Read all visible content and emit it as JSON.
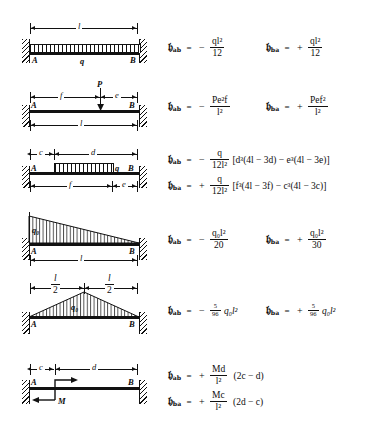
{
  "symbols": {
    "moment": "\u0001",
    "moment_ab_sub": "ab",
    "moment_ba_sub": "ba",
    "equals": "=",
    "minus": "−",
    "plus": "+",
    "node_a": "A",
    "node_b": "B"
  },
  "rows": [
    {
      "id": "uniform-full-span",
      "diagram": {
        "load_type": "uniform-distributed",
        "load_label": "q",
        "span_label": "l",
        "supports": [
          "fixed",
          "fixed"
        ],
        "nodes": [
          "A",
          "B"
        ]
      },
      "left": {
        "symbol_sub": "ab",
        "sign": "−",
        "numerator": "ql²",
        "denominator": "12",
        "num_var": "q",
        "num_var2": "l",
        "num_exp": "2"
      },
      "right": {
        "symbol_sub": "ba",
        "sign": "+",
        "numerator": "ql²",
        "denominator": "12",
        "num_var": "q",
        "num_var2": "l",
        "num_exp": "2"
      }
    },
    {
      "id": "point-load",
      "diagram": {
        "load_type": "point-load",
        "load_label": "P",
        "dim_left": "f",
        "dim_right": "e",
        "span_label": "l",
        "supports": [
          "fixed",
          "fixed"
        ],
        "nodes": [
          "A",
          "B"
        ]
      },
      "left": {
        "symbol_sub": "ab",
        "sign": "−",
        "numerator": "Pe²f",
        "denominator": "l²"
      },
      "right": {
        "symbol_sub": "ba",
        "sign": "+",
        "numerator": "Pef²",
        "denominator": "l²"
      }
    },
    {
      "id": "partial-uniform",
      "diagram": {
        "load_type": "partial-uniform-distributed",
        "load_label": "q",
        "dim_c": "c",
        "dim_d": "d",
        "dim_f": "f",
        "dim_e": "e",
        "supports": [
          "fixed",
          "fixed"
        ],
        "nodes": [
          "A",
          "B"
        ]
      },
      "left": {
        "symbol_sub": "ab",
        "sign": "−",
        "numerator": "q",
        "denominator": "12l²",
        "bracket": "[d³(4l − 3d) − e³(4l − 3e)]"
      },
      "right": {
        "symbol_sub": "ba",
        "sign": "+",
        "numerator": "q",
        "denominator": "12l²",
        "bracket": "[f³(4l − 3f) − c³(4l − 3c)]"
      }
    },
    {
      "id": "triangular-decreasing",
      "diagram": {
        "load_type": "triangular-load",
        "load_label": "q₀",
        "span_label": "l",
        "supports": [
          "fixed",
          "fixed"
        ],
        "nodes": [
          "A",
          "B"
        ]
      },
      "left": {
        "symbol_sub": "ab",
        "sign": "−",
        "numerator": "q₀l²",
        "denominator": "20"
      },
      "right": {
        "symbol_sub": "ba",
        "sign": "+",
        "numerator": "q₀l²",
        "denominator": "30"
      }
    },
    {
      "id": "triangular-symmetric",
      "diagram": {
        "load_type": "symmetric-triangular-load",
        "load_label": "q₀",
        "dim_left_num": "l",
        "dim_left_den": "2",
        "dim_right_num": "l",
        "dim_right_den": "2",
        "supports": [
          "fixed",
          "fixed"
        ],
        "nodes": [
          "A",
          "B"
        ]
      },
      "left": {
        "symbol_sub": "ab",
        "sign": "−",
        "coef_num": "5",
        "coef_den": "96",
        "trailing": "q₀l²"
      },
      "right": {
        "symbol_sub": "ba",
        "sign": "+",
        "coef_num": "5",
        "coef_den": "96",
        "trailing": "q₀l²"
      }
    },
    {
      "id": "applied-moment",
      "diagram": {
        "load_type": "applied-moment",
        "load_label": "M",
        "dim_c": "c",
        "dim_d": "d",
        "supports": [
          "fixed",
          "fixed"
        ],
        "nodes": [
          "A",
          "B"
        ]
      },
      "left": {
        "symbol_sub": "ab",
        "sign": "+",
        "numerator": "Md",
        "denominator": "l²",
        "bracket": "(2c − d)"
      },
      "right": {
        "symbol_sub": "ba",
        "sign": "+",
        "numerator": "Mc",
        "denominator": "l²",
        "bracket": "(2d − c)"
      }
    }
  ]
}
